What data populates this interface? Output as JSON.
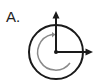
{
  "diagram": {
    "label": "A.",
    "elements": {
      "outer_circle": {
        "cx": 56,
        "cy": 52,
        "r": 27,
        "color": "#1a1a1a"
      },
      "inner_arc": {
        "r": 18,
        "color": "#888888",
        "direction": "clockwise",
        "arrowhead": "top"
      },
      "vertical_arrow": {
        "direction": "up",
        "color": "#1a1a1a"
      },
      "horizontal_arrow": {
        "direction": "right",
        "color": "#1a1a1a"
      },
      "center_dot": {
        "color": "#1a1a1a"
      }
    }
  }
}
